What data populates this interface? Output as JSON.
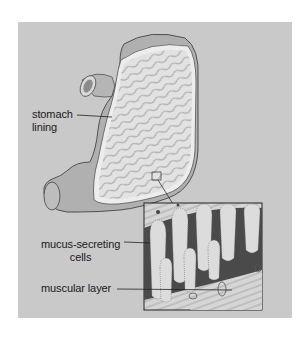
{
  "diagram": {
    "labels": {
      "stomach_lining_1": "stomach",
      "stomach_lining_2": "lining",
      "mucus_1": "mucus-secreting",
      "mucus_2": "cells",
      "muscular": "muscular layer"
    },
    "colors": {
      "background": "#ffffff",
      "panel": "#c9c9c9",
      "outline": "#333333",
      "lining": "#e4e4e4",
      "inset_dark": "#4a4a4a"
    }
  }
}
